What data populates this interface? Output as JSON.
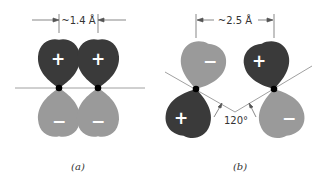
{
  "colors": {
    "positive_lobe": "#3a3a3a",
    "negative_lobe": "#9a9a9a",
    "line": "#888888",
    "atom": "#000000"
  },
  "panel_a": {
    "distance_label": "~1.4 Å",
    "caption": "(a)",
    "lobes": [
      {
        "position": "upper-left",
        "sign": "+"
      },
      {
        "position": "upper-right",
        "sign": "+"
      },
      {
        "position": "lower-left",
        "sign": "−"
      },
      {
        "position": "lower-right",
        "sign": "−"
      }
    ]
  },
  "panel_b": {
    "distance_label": "~2.5 Å",
    "angle_label": "120°",
    "caption": "(b)",
    "lobes": [
      {
        "position": "upper-left",
        "sign": "−"
      },
      {
        "position": "upper-right",
        "sign": "+"
      },
      {
        "position": "lower-left",
        "sign": "+"
      },
      {
        "position": "lower-right",
        "sign": "−"
      }
    ]
  }
}
